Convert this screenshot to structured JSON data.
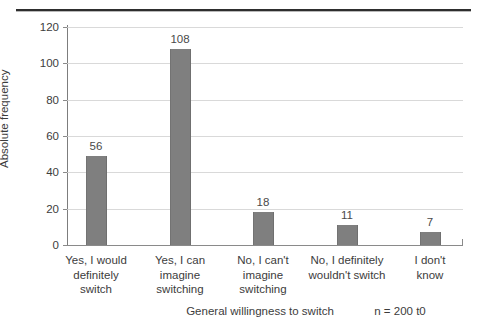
{
  "chart_data": {
    "type": "bar",
    "title": "",
    "categories": [
      "Yes, I would definitely switch",
      "Yes, I can imagine switching",
      "No, I can't imagine switching",
      "No, I definitely wouldn't switch",
      "I don't know"
    ],
    "category_lines": [
      [
        "Yes, I would",
        "definitely",
        "switch"
      ],
      [
        "Yes, I can",
        "imagine",
        "switching"
      ],
      [
        "No, I can't",
        "imagine",
        "switching"
      ],
      [
        "No, I definitely",
        "wouldn't switch"
      ],
      [
        "I don't",
        "know"
      ]
    ],
    "values": [
      56,
      108,
      18,
      11,
      7
    ],
    "value_labels": [
      "56",
      "108",
      "18",
      "11",
      "7"
    ],
    "xlabel": "General willingness to switch",
    "ylabel": "Absolute frequency",
    "ylim": [
      0,
      120
    ],
    "ytick_labels": [
      "0",
      "20",
      "40",
      "60",
      "80",
      "100",
      "120"
    ],
    "ytick_values": [
      0,
      20,
      40,
      60,
      80,
      100,
      120
    ],
    "grid": true,
    "legend": false,
    "annotation": "n = 200 t0",
    "bar_color": "#7f7f7f",
    "grid_color": "#d2d2d2",
    "axis_color": "#8a8a8a",
    "text_color": "#3c3c3c"
  }
}
